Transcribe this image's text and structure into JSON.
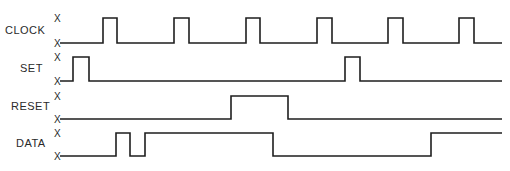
{
  "title": "",
  "x_marker": "X",
  "colors": {
    "line": "#1e1e1e",
    "text": "#2a2a2a",
    "background": "#ffffff"
  },
  "x_start": 60,
  "x_end": 502,
  "signals": [
    {
      "name": "CLOCK",
      "label_x": 5,
      "label_y": 34,
      "high_y": 18,
      "low_y": 43,
      "initial": "low",
      "transitions": [
        103,
        117,
        174,
        189,
        246,
        260,
        317,
        332,
        388,
        403,
        459,
        474
      ]
    },
    {
      "name": "SET",
      "label_x": 20,
      "label_y": 72,
      "high_y": 57,
      "low_y": 81,
      "initial": "low",
      "transitions": [
        73,
        89,
        345,
        360
      ]
    },
    {
      "name": "RESET",
      "label_x": 11,
      "label_y": 110,
      "high_y": 96,
      "low_y": 119,
      "initial": "low",
      "transitions": [
        231,
        288
      ]
    },
    {
      "name": "DATA",
      "label_x": 16,
      "label_y": 147,
      "high_y": 133,
      "low_y": 156,
      "initial": "low",
      "transitions": [
        116,
        130,
        145,
        273,
        431
      ]
    }
  ]
}
